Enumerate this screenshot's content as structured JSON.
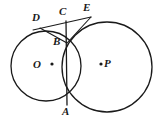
{
  "figure": {
    "kind": "geometry-diagram",
    "width": 156,
    "height": 121,
    "background_color": "#ffffff",
    "stroke_color": "#1a1a1a",
    "label_color": "#1a1a1a"
  },
  "circles": [
    {
      "id": "circle-o",
      "center_label": "O",
      "cx": 46,
      "cy": 66,
      "r": 35,
      "stroke_width": 1.3
    },
    {
      "id": "circle-p",
      "center_label": "P",
      "cx": 107,
      "cy": 67,
      "r": 45,
      "stroke_width": 1.3
    }
  ],
  "center_dots": [
    {
      "id": "dot-o",
      "label": "O",
      "cx": 52,
      "cy": 64,
      "r": 1.6,
      "label_x": 33,
      "label_y": 59
    },
    {
      "id": "dot-p",
      "label": "P",
      "cx": 101,
      "cy": 64,
      "r": 1.6,
      "label_x": 104,
      "label_y": 58
    }
  ],
  "points": [
    {
      "id": "point-a",
      "label": "A",
      "x": 67,
      "y": 104,
      "label_x": 62,
      "label_y": 106
    },
    {
      "id": "point-b",
      "label": "B",
      "x": 66,
      "y": 42,
      "label_x": 53,
      "label_y": 36
    },
    {
      "id": "point-c",
      "label": "C",
      "x": 66,
      "y": 22,
      "label_x": 59,
      "label_y": 6
    },
    {
      "id": "point-d",
      "label": "D",
      "x": 45,
      "y": 27,
      "label_x": 32,
      "label_y": 12
    },
    {
      "id": "point-e",
      "label": "E",
      "x": 87,
      "y": 18,
      "label_x": 83,
      "label_y": 2
    }
  ],
  "segments": [
    {
      "id": "seg-de",
      "from": "D",
      "to": "E",
      "x1": 33,
      "y1": 30,
      "x2": 91,
      "y2": 17,
      "stroke_width": 1.1
    },
    {
      "id": "seg-db",
      "from": "D",
      "to": "B",
      "x1": 40,
      "y1": 28,
      "x2": 67,
      "y2": 43,
      "stroke_width": 1.1
    },
    {
      "id": "seg-be",
      "from": "B",
      "to": "E",
      "x1": 67,
      "y1": 43,
      "x2": 91,
      "y2": 17,
      "stroke_width": 1.1
    },
    {
      "id": "seg-ca",
      "from": "C",
      "to": "A",
      "x1": 66,
      "y1": 21,
      "x2": 67,
      "y2": 105,
      "stroke_width": 1.3
    }
  ],
  "labels": {
    "a": "A",
    "b": "B",
    "c": "C",
    "d": "D",
    "e": "E",
    "o": "O",
    "p": "P"
  }
}
